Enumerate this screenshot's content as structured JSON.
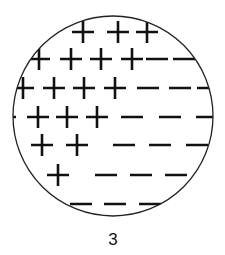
{
  "diagram": {
    "label": "3",
    "colors": {
      "stroke": "#111111",
      "background": "#ffffff"
    },
    "rows": [
      [
        "+",
        "+",
        "+"
      ],
      [
        "+",
        "+",
        "+",
        "+",
        "-",
        "-"
      ],
      [
        "+",
        "+",
        "+",
        "+",
        "-",
        "-",
        "-"
      ],
      [
        "-",
        "+",
        "+",
        "+",
        "-",
        "-",
        "-"
      ],
      [
        "+",
        "+",
        "-",
        "-",
        "-"
      ],
      [
        "-",
        "+",
        "-",
        "-",
        "-"
      ],
      [
        "-",
        "-",
        "-"
      ]
    ]
  }
}
